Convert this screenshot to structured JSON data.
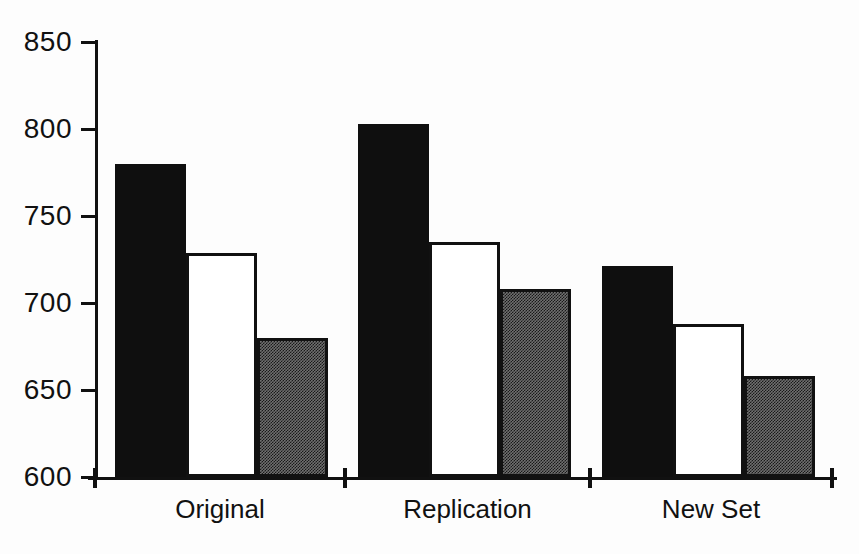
{
  "chart_data": {
    "type": "bar",
    "categories": [
      "Original",
      "Replication",
      "New Set"
    ],
    "series": [
      {
        "name": "solid-black",
        "style": "solid-black-fill",
        "values": [
          780,
          803,
          721
        ]
      },
      {
        "name": "white",
        "style": "white-fill-black-outline",
        "values": [
          729,
          735,
          688
        ]
      },
      {
        "name": "stippled-gray",
        "style": "dark-stipple-fill-black-outline",
        "values": [
          680,
          708,
          658
        ]
      }
    ],
    "title": "",
    "xlabel": "",
    "ylabel": "",
    "ylim": [
      600,
      850
    ],
    "yticks": [
      600,
      650,
      700,
      750,
      800,
      850
    ],
    "grid": false,
    "legend": "none"
  },
  "colors": {
    "axis": "#111111",
    "bar_solid_black": "#0f0f0f",
    "bar_white_fill": "#ffffff",
    "bar_outline": "#111111",
    "bar_stipple_base": "#6f6f6f",
    "bar_stipple_dot": "#191919",
    "background": "#fdfdfd"
  }
}
